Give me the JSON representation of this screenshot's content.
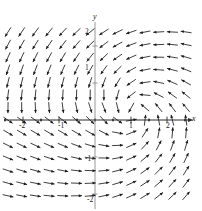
{
  "figure": {
    "kind": "direction-field",
    "caption_top": "",
    "background_color": "#ffffff",
    "arrow_color": "#1c1c1c",
    "axis_color": "#8c8c8c"
  },
  "axes": {
    "x_label": "x",
    "y_label": "y",
    "x_axis_pixel_y": 120,
    "y_axis_pixel_x": 95,
    "x_tick_labels": [
      "-2",
      "-1",
      "1",
      "2"
    ],
    "y_tick_labels": [
      "2",
      "1",
      "-1",
      "-2"
    ],
    "xlim": [
      -2.6,
      2.6
    ],
    "ylim": [
      -2.6,
      2.6
    ],
    "pixels_per_unit_x": 36,
    "pixels_per_unit_y": 37
  },
  "chart_data": {
    "type": "scatter",
    "title": "",
    "xlabel": "x",
    "ylabel": "y",
    "xlim": [
      -2.6,
      2.6
    ],
    "ylim": [
      -2.6,
      2.6
    ],
    "grid": false,
    "legend": null,
    "field": {
      "description": "slope / direction field of arrows on a regular grid",
      "grid_columns": 14,
      "grid_rows": 14,
      "x_start_px": 8,
      "y_start_px": 32,
      "step_x_px": 13.7,
      "step_y_px": 12.6,
      "arrow_length_px": 11,
      "arrow_head_px": 3.2,
      "rotation_center_px": [
        134,
        112
      ],
      "angle_formula_note": "direction rotates around a focus right of origin; base orientation left-up in quadrant II, up-right in quadrant III, right-up in quadrant IV, down-left in quadrant I"
    }
  }
}
